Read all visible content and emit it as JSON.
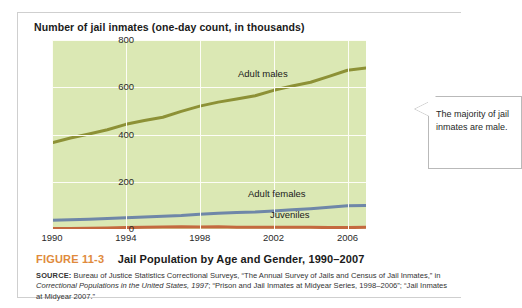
{
  "figure": {
    "number": "FIGURE 11-3",
    "title": "Jail Population by Age and Gender, 1990–2007",
    "source_label": "SOURCE:",
    "source_text_1": " Bureau of Justice Statistics Correctional Surveys, “The Annual Survey of Jails and Census of Jail Inmates,” in ",
    "source_italic_1": "Correctional Populations in the United States, 1997",
    "source_text_2": "; “Prison and Jail Inmates at Midyear Series, 1998–2006”; “Jail Inmates at Midyear 2007.”"
  },
  "callout": {
    "text": "The majority of jail inmates are male."
  },
  "chart_data": {
    "type": "line",
    "title": "Number of jail inmates (one-day count, in thousands)",
    "xlabel": "",
    "ylabel": "",
    "xlim": [
      1990,
      2007
    ],
    "ylim": [
      0,
      800
    ],
    "yticks": [
      0,
      200,
      400,
      600,
      800
    ],
    "xticks": [
      1990,
      1994,
      1998,
      2002,
      2006
    ],
    "grid": true,
    "legend": "inline-labels",
    "plot_background": "#dbe8b4",
    "x": [
      1990,
      1991,
      1992,
      1993,
      1994,
      1995,
      1996,
      1997,
      1998,
      1999,
      2000,
      2001,
      2002,
      2003,
      2004,
      2005,
      2006,
      2007
    ],
    "series": [
      {
        "name": "Adult males",
        "color": "#8d9136",
        "label_text": "Adult males",
        "values": [
          365,
          385,
          402,
          420,
          443,
          459,
          473,
          498,
          520,
          537,
          550,
          564,
          587,
          605,
          621,
          646,
          672,
          681
        ]
      },
      {
        "name": "Adult females",
        "color": "#6f87a8",
        "label_text": "Adult females",
        "values": [
          37,
          39,
          41,
          44,
          48,
          51,
          54,
          57,
          62,
          67,
          70,
          72,
          76,
          81,
          86,
          92,
          98,
          100
        ]
      },
      {
        "name": "Juveniles",
        "color": "#c4693f",
        "label_text": "Juveniles",
        "values": [
          2,
          2,
          3,
          4,
          6,
          7,
          8,
          9,
          8,
          9,
          7,
          7,
          7,
          7,
          7,
          6,
          6,
          7
        ]
      }
    ]
  }
}
